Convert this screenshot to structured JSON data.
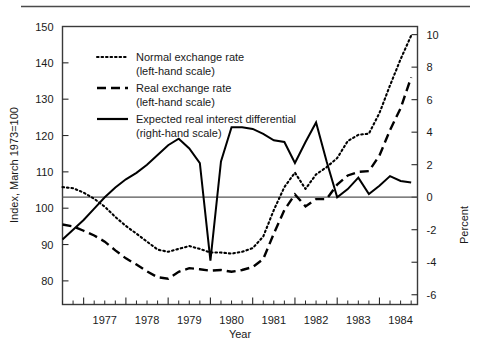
{
  "chart_data": {
    "type": "line",
    "title": "",
    "xlabel": "Year",
    "ylabel": "Index, March 1973=100",
    "y2label": "Percent",
    "xlim": [
      1976.5,
      1984.9
    ],
    "ylim": [
      73.5,
      150
    ],
    "y2lim": [
      -6.6,
      10.5
    ],
    "grid": false,
    "legend_position": "upper-left-inside",
    "x_tick_labels": [
      "1977",
      "1978",
      "1979",
      "1980",
      "1981",
      "1982",
      "1983",
      "1984"
    ],
    "x_tick_values": [
      1977,
      1978,
      1979,
      1980,
      1981,
      1982,
      1983,
      1984
    ],
    "x_minor_interval": 0.25,
    "y_tick_labels": [
      "80",
      "90",
      "100",
      "110",
      "120",
      "130",
      "140",
      "150"
    ],
    "y_tick_values": [
      80,
      90,
      100,
      110,
      120,
      130,
      140,
      150
    ],
    "y2_tick_labels": [
      "-6",
      "-4",
      "-2",
      "0",
      "2",
      "4",
      "6",
      "8",
      "10"
    ],
    "y2_tick_values": [
      -6,
      -4,
      -2,
      0,
      2,
      4,
      6,
      8,
      10
    ],
    "zero_reference_line": 0,
    "x": [
      1976.5,
      1976.75,
      1977.0,
      1977.25,
      1977.5,
      1977.75,
      1978.0,
      1978.25,
      1978.5,
      1978.75,
      1979.0,
      1979.25,
      1979.5,
      1979.75,
      1980.0,
      1980.25,
      1980.5,
      1980.75,
      1981.0,
      1981.25,
      1981.5,
      1981.75,
      1982.0,
      1982.25,
      1982.5,
      1982.75,
      1983.0,
      1983.25,
      1983.5,
      1983.75,
      1984.0,
      1984.25,
      1984.5,
      1984.75
    ],
    "series": [
      {
        "name": "Normal exchange rate",
        "scale": "left",
        "style": "dotted",
        "values": [
          105.8,
          105.5,
          104.3,
          102.6,
          100.4,
          97.6,
          95.1,
          93.0,
          90.8,
          88.6,
          88.0,
          88.8,
          89.6,
          88.8,
          87.8,
          87.8,
          87.5,
          88.0,
          89.0,
          92.2,
          99.5,
          105.8,
          109.8,
          105.3,
          109.3,
          111.3,
          113.8,
          118.5,
          120.2,
          120.5,
          126.2,
          133.8,
          141.0,
          147.5
        ]
      },
      {
        "name": "Real exchange rate",
        "scale": "left",
        "style": "dashed",
        "values": [
          95.5,
          95.0,
          93.8,
          92.5,
          90.8,
          88.4,
          86.2,
          84.5,
          82.6,
          81.0,
          80.6,
          82.5,
          83.5,
          83.2,
          82.8,
          83.0,
          82.5,
          83.0,
          83.8,
          86.0,
          93.0,
          99.5,
          103.8,
          100.5,
          102.5,
          102.5,
          106.5,
          109.0,
          110.0,
          110.2,
          114.5,
          121.5,
          127.5,
          136.0
        ]
      },
      {
        "name": "Expected real interest differential",
        "scale": "right",
        "style": "solid",
        "values": [
          -2.6,
          -2.0,
          -1.4,
          -0.7,
          0.0,
          0.6,
          1.1,
          1.5,
          2.0,
          2.6,
          3.2,
          3.6,
          3.0,
          2.1,
          -3.9,
          2.2,
          4.3,
          4.3,
          4.2,
          3.9,
          3.5,
          3.4,
          2.1,
          3.4,
          4.6,
          2.2,
          0.0,
          0.5,
          1.2,
          0.2,
          0.7,
          1.3,
          1.0,
          0.9
        ]
      }
    ],
    "legend": [
      {
        "line1": "Normal exchange rate",
        "line2": "(left-hand scale)",
        "style": "dotted"
      },
      {
        "line1": "Real exchange rate",
        "line2": "(left-hand scale)",
        "style": "dashed"
      },
      {
        "line1": "Expected real interest differential",
        "line2": "(right-hand scale)",
        "style": "solid"
      }
    ]
  }
}
